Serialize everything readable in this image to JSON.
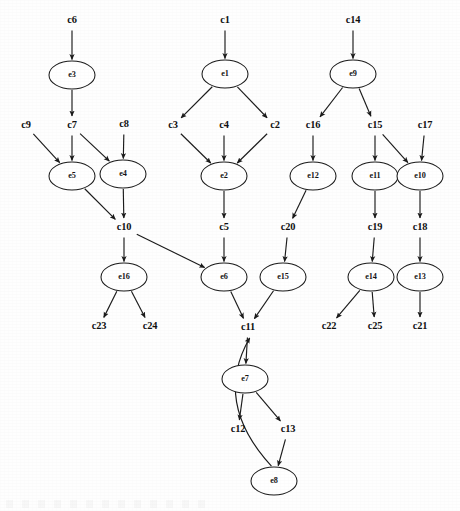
{
  "diagram": {
    "type": "directed-graph",
    "width": 460,
    "height": 511,
    "stroke_color": "#1b1b1b",
    "background_color": "#ffffff",
    "node_fill": "#ffffff"
  },
  "nodes": {
    "events": [
      {
        "id": "e3",
        "label": "e3",
        "cx": 72,
        "cy": 75,
        "rx": 23,
        "ry": 14
      },
      {
        "id": "e5",
        "label": "e5",
        "cx": 72,
        "cy": 176,
        "rx": 23,
        "ry": 14
      },
      {
        "id": "e4",
        "label": "e4",
        "cx": 123,
        "cy": 174,
        "rx": 23,
        "ry": 14
      },
      {
        "id": "e16",
        "label": "e16",
        "cx": 124,
        "cy": 277,
        "rx": 23,
        "ry": 14
      },
      {
        "id": "e1",
        "label": "e1",
        "cx": 225,
        "cy": 74,
        "rx": 23,
        "ry": 14
      },
      {
        "id": "e2",
        "label": "e2",
        "cx": 224,
        "cy": 176,
        "rx": 23,
        "ry": 14
      },
      {
        "id": "e6",
        "label": "e6",
        "cx": 224,
        "cy": 277,
        "rx": 23,
        "ry": 14
      },
      {
        "id": "e15",
        "label": "e15",
        "cx": 283,
        "cy": 277,
        "rx": 23,
        "ry": 14
      },
      {
        "id": "e9",
        "label": "e9",
        "cx": 353,
        "cy": 74,
        "rx": 23,
        "ry": 14
      },
      {
        "id": "e12",
        "label": "e12",
        "cx": 313,
        "cy": 176,
        "rx": 23,
        "ry": 14
      },
      {
        "id": "e11",
        "label": "e11",
        "cx": 375,
        "cy": 176,
        "rx": 23,
        "ry": 14
      },
      {
        "id": "e10",
        "label": "e10",
        "cx": 420,
        "cy": 176,
        "rx": 23,
        "ry": 14
      },
      {
        "id": "e14",
        "label": "e14",
        "cx": 371,
        "cy": 277,
        "rx": 23,
        "ry": 14
      },
      {
        "id": "e13",
        "label": "e13",
        "cx": 420,
        "cy": 277,
        "rx": 23,
        "ry": 14
      },
      {
        "id": "e7",
        "label": "e7",
        "cx": 245,
        "cy": 379,
        "rx": 23,
        "ry": 14
      },
      {
        "id": "e8",
        "label": "e8",
        "cx": 274,
        "cy": 481,
        "rx": 23,
        "ry": 14
      }
    ],
    "conditions": [
      {
        "id": "c6",
        "label": "c6",
        "x": 72,
        "y": 21
      },
      {
        "id": "c9",
        "label": "c9",
        "x": 26,
        "y": 126
      },
      {
        "id": "c7",
        "label": "c7",
        "x": 72,
        "y": 126
      },
      {
        "id": "c8",
        "label": "c8",
        "x": 124,
        "y": 125
      },
      {
        "id": "c10",
        "label": "c10",
        "x": 124,
        "y": 228
      },
      {
        "id": "c23",
        "label": "c23",
        "x": 99,
        "y": 327
      },
      {
        "id": "c24",
        "label": "c24",
        "x": 150,
        "y": 327
      },
      {
        "id": "c1",
        "label": "c1",
        "x": 225,
        "y": 21
      },
      {
        "id": "c3",
        "label": "c3",
        "x": 173,
        "y": 126
      },
      {
        "id": "c4",
        "label": "c4",
        "x": 224,
        "y": 126
      },
      {
        "id": "c2",
        "label": "c2",
        "x": 275,
        "y": 126
      },
      {
        "id": "c5",
        "label": "c5",
        "x": 224,
        "y": 228
      },
      {
        "id": "c11",
        "label": "c11",
        "x": 248,
        "y": 328
      },
      {
        "id": "c12",
        "label": "c12",
        "x": 238,
        "y": 430
      },
      {
        "id": "c13",
        "label": "c13",
        "x": 288,
        "y": 430
      },
      {
        "id": "c14",
        "label": "c14",
        "x": 353,
        "y": 21
      },
      {
        "id": "c16",
        "label": "c16",
        "x": 313,
        "y": 126
      },
      {
        "id": "c15",
        "label": "c15",
        "x": 375,
        "y": 126
      },
      {
        "id": "c17",
        "label": "c17",
        "x": 425,
        "y": 126
      },
      {
        "id": "c20",
        "label": "c20",
        "x": 288,
        "y": 228
      },
      {
        "id": "c19",
        "label": "c19",
        "x": 375,
        "y": 228
      },
      {
        "id": "c18",
        "label": "c18",
        "x": 420,
        "y": 228
      },
      {
        "id": "c22",
        "label": "c22",
        "x": 329,
        "y": 327
      },
      {
        "id": "c25",
        "label": "c25",
        "x": 375,
        "y": 327
      },
      {
        "id": "c21",
        "label": "c21",
        "x": 420,
        "y": 327
      }
    ]
  },
  "edges": [
    {
      "from": "c6",
      "to": "e3"
    },
    {
      "from": "e3",
      "to": "c7"
    },
    {
      "from": "c9",
      "to": "e5"
    },
    {
      "from": "c7",
      "to": "e5"
    },
    {
      "from": "c7",
      "to": "e4"
    },
    {
      "from": "c8",
      "to": "e4"
    },
    {
      "from": "e5",
      "to": "c10"
    },
    {
      "from": "e4",
      "to": "c10"
    },
    {
      "from": "c10",
      "to": "e16"
    },
    {
      "from": "c10",
      "to": "e6"
    },
    {
      "from": "e16",
      "to": "c23"
    },
    {
      "from": "e16",
      "to": "c24"
    },
    {
      "from": "c1",
      "to": "e1"
    },
    {
      "from": "e1",
      "to": "c3"
    },
    {
      "from": "e1",
      "to": "c2"
    },
    {
      "from": "c3",
      "to": "e2"
    },
    {
      "from": "c4",
      "to": "e2"
    },
    {
      "from": "c2",
      "to": "e2"
    },
    {
      "from": "e2",
      "to": "c5"
    },
    {
      "from": "c5",
      "to": "e6"
    },
    {
      "from": "e6",
      "to": "c11"
    },
    {
      "from": "e15",
      "to": "c11"
    },
    {
      "from": "c14",
      "to": "e9"
    },
    {
      "from": "e9",
      "to": "c16"
    },
    {
      "from": "e9",
      "to": "c15"
    },
    {
      "from": "c16",
      "to": "e12"
    },
    {
      "from": "e12",
      "to": "c20"
    },
    {
      "from": "c20",
      "to": "e15"
    },
    {
      "from": "c15",
      "to": "e11"
    },
    {
      "from": "c15",
      "to": "e10"
    },
    {
      "from": "c17",
      "to": "e10"
    },
    {
      "from": "e11",
      "to": "c19"
    },
    {
      "from": "e10",
      "to": "c18"
    },
    {
      "from": "c19",
      "to": "e14"
    },
    {
      "from": "c18",
      "to": "e13"
    },
    {
      "from": "e14",
      "to": "c22"
    },
    {
      "from": "e14",
      "to": "c25"
    },
    {
      "from": "e13",
      "to": "c21"
    },
    {
      "from": "c11",
      "to": "e7"
    },
    {
      "from": "e7",
      "to": "c12"
    },
    {
      "from": "e7",
      "to": "c13"
    },
    {
      "from": "c13",
      "to": "e8"
    },
    {
      "from": "e8",
      "to": "c11",
      "curved": true
    }
  ]
}
